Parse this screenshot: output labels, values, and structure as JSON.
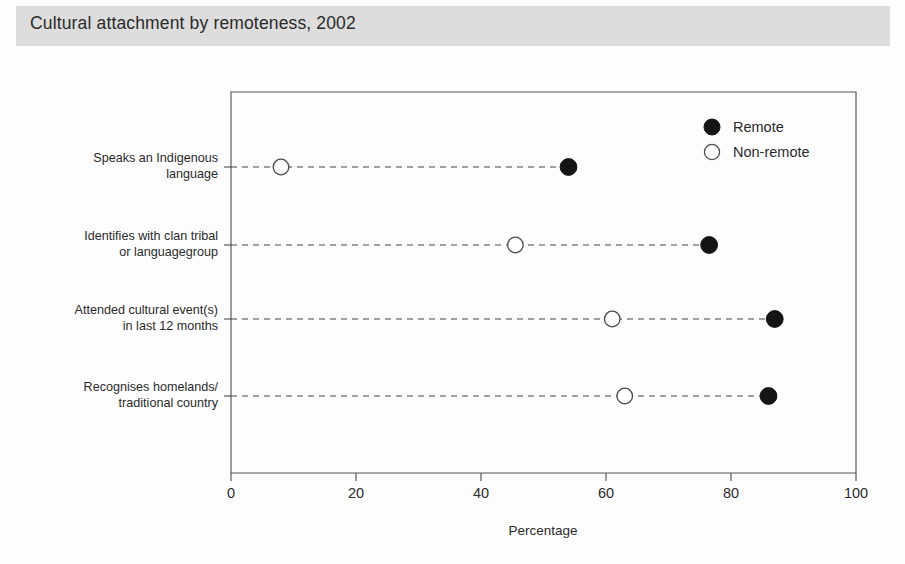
{
  "title": "Cultural attachment by remoteness, 2002",
  "axis": {
    "xlabel": "Percentage",
    "ticks": [
      "0",
      "20",
      "40",
      "60",
      "80",
      "100"
    ]
  },
  "legend": {
    "items": [
      {
        "label": "Remote",
        "marker": "filled-circle",
        "color": "#141414"
      },
      {
        "label": "Non-remote",
        "marker": "open-circle",
        "color": "#ffffff"
      }
    ]
  },
  "categories": [
    {
      "line1": "Speaks an Indigenous",
      "line2": "language"
    },
    {
      "line1": "Identifies with clan tribal",
      "line2": "or languagegroup"
    },
    {
      "line1": "Attended cultural event(s)",
      "line2": "in last 12 months"
    },
    {
      "line1": "Recognises homelands/",
      "line2": "traditional country"
    }
  ],
  "chart_data": {
    "type": "scatter",
    "title": "Cultural attachment by remoteness, 2002",
    "xlabel": "Percentage",
    "ylabel": "",
    "xlim": [
      0,
      100
    ],
    "xticks": [
      0,
      20,
      40,
      60,
      80,
      100
    ],
    "grid": false,
    "legend_position": "top-right",
    "categories": [
      "Speaks an Indigenous language",
      "Identifies with clan tribal or languagegroup",
      "Attended cultural event(s) in last 12 months",
      "Recognises homelands/ traditional country"
    ],
    "series": [
      {
        "name": "Remote",
        "marker": "filled-circle",
        "values": [
          54,
          76.5,
          87,
          86
        ]
      },
      {
        "name": "Non-remote",
        "marker": "open-circle",
        "values": [
          8,
          45.5,
          61,
          63
        ]
      }
    ]
  }
}
